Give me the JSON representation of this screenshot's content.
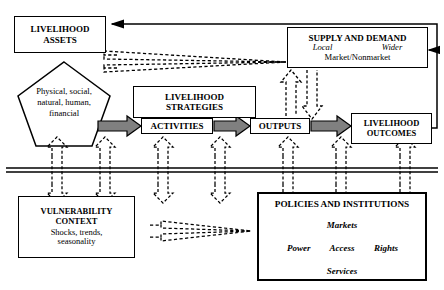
{
  "diagram": {
    "nodes": {
      "livelihood_assets": {
        "label": "LIVELIHOOD ASSETS",
        "line1": "LIVELIHOOD",
        "line2": "ASSETS"
      },
      "assets_pentagon": {
        "line1": "Physical, social,",
        "line2": "natural, human,",
        "line3": "financial"
      },
      "livelihood_strategies": {
        "line1": "LIVELIHOOD",
        "line2": "STRATEGIES"
      },
      "activities": {
        "label": "ACTIVITIES"
      },
      "outputs": {
        "label": "OUTPUTS"
      },
      "supply_and_demand": {
        "title": "SUPPLY AND DEMAND",
        "local": "Local",
        "wider": "Wider",
        "market": "Market/Nonmarket"
      },
      "livelihood_outcomes": {
        "line1": "LIVELIHOOD",
        "line2": "OUTCOMES"
      },
      "vulnerability_context": {
        "line1": "VULNERABILITY",
        "line2": "CONTEXT",
        "line3": "Shocks, trends,",
        "line4": "seasonality"
      },
      "policies_and_institutions": {
        "title": "POLICIES AND INSTITUTIONS",
        "markets": "Markets",
        "power": "Power",
        "access": "Access",
        "rights": "Rights",
        "services": "Services"
      }
    },
    "colors": {
      "stroke": "#000000",
      "background": "#ffffff",
      "thick_arrow_fill": "#808080",
      "thick_arrow_stroke": "#000000"
    }
  }
}
